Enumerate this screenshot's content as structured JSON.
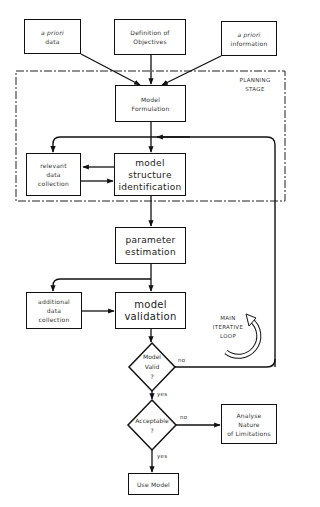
{
  "diagram": {
    "inputs": {
      "a_priori_data": [
        "a priori",
        "data"
      ],
      "definition": [
        "Definition of",
        "Objectives"
      ],
      "a_priori_information": [
        "a priori",
        "information"
      ]
    },
    "planning_stage": [
      "PLANNING",
      "STAGE"
    ],
    "model_formulation": [
      "Model",
      "Formulation"
    ],
    "relevant_data": [
      "relevant",
      "data",
      "collection"
    ],
    "structure_id": [
      "model",
      "structure",
      "identification"
    ],
    "parameter_estimation": [
      "parameter",
      "estimation"
    ],
    "additional_data": [
      "additional",
      "data",
      "collection"
    ],
    "model_validation": [
      "model",
      "validation"
    ],
    "main_loop": [
      "MAIN",
      "ITERATIVE",
      "LOOP"
    ],
    "decision_valid": [
      "Model",
      "Valid",
      "?"
    ],
    "decision_acceptable": [
      "Acceptable",
      "?"
    ],
    "analyse": [
      "Analyse",
      "Nature",
      "of Limitations"
    ],
    "use_model": "Use Model",
    "edge_labels": {
      "valid_no": "no",
      "valid_yes": "yes",
      "acceptable_no": "no",
      "acceptable_yes": "yes"
    }
  }
}
